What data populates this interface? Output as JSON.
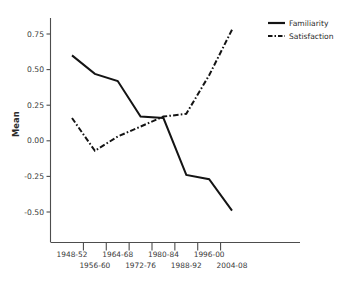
{
  "chart_data": {
    "type": "line",
    "title": "",
    "subtitle": "",
    "xlabel": "",
    "ylabel": "Mean",
    "categories": [
      "1948-52",
      "1956-60",
      "1964-68",
      "1972-76",
      "1980-84",
      "1988-92",
      "1996-00",
      "2004-08"
    ],
    "x_tick_labels": [
      "1948-52",
      "1956-60",
      "1964-68",
      "1972-76",
      "1980-84",
      "1988-92",
      "1996-00",
      "2004-08"
    ],
    "y_tick_labels": [
      "0.75",
      "0.50",
      "0.25",
      "0.00",
      "-0.25",
      "-0.50"
    ],
    "y_tick_values": [
      0.75,
      0.5,
      0.25,
      0.0,
      -0.25,
      -0.5
    ],
    "ylim": [
      -0.62,
      0.88
    ],
    "xlim": [
      -0.6,
      7.7
    ],
    "grid": false,
    "legend_position": "top-right",
    "series": [
      {
        "name": "Familiarity",
        "style": "solid",
        "color": "#141414",
        "values": [
          0.6,
          0.47,
          0.42,
          0.17,
          0.16,
          -0.24,
          -0.27,
          -0.49
        ]
      },
      {
        "name": "Satisfaction",
        "style": "dash-dot",
        "color": "#141414",
        "values": [
          0.16,
          -0.07,
          0.03,
          0.1,
          0.17,
          0.19,
          0.46,
          0.78
        ]
      }
    ]
  },
  "legend": {
    "entries": [
      {
        "label": "Familiarity",
        "style": "solid"
      },
      {
        "label": "Satisfaction",
        "style": "dash-dot"
      }
    ]
  },
  "axes": {
    "y_title": "Mean"
  }
}
